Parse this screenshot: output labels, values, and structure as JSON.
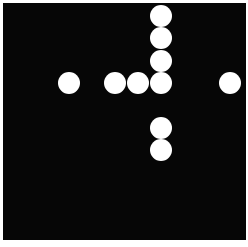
{
  "board": {
    "background": "#060606",
    "dot_color": "#ffffff",
    "dot_diameter": 22
  },
  "dots": [
    {
      "x": 161,
      "y": 16
    },
    {
      "x": 161,
      "y": 38
    },
    {
      "x": 161,
      "y": 61
    },
    {
      "x": 69,
      "y": 83
    },
    {
      "x": 115,
      "y": 83
    },
    {
      "x": 138,
      "y": 83
    },
    {
      "x": 161,
      "y": 83
    },
    {
      "x": 230,
      "y": 83
    },
    {
      "x": 161,
      "y": 128
    },
    {
      "x": 161,
      "y": 150
    }
  ]
}
